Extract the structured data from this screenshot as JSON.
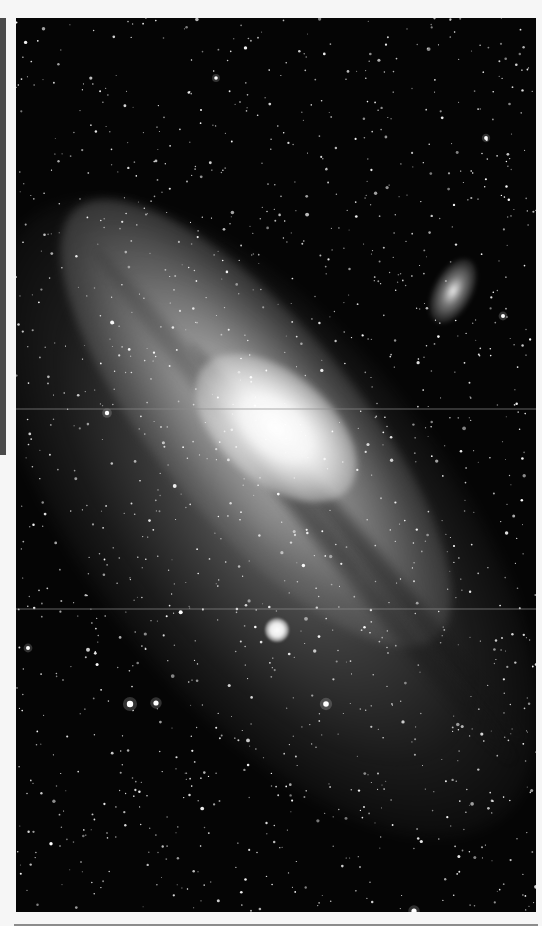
{
  "page": {
    "type": "scanned-book-page",
    "background_color": "#f6f6f6",
    "side_caption": {
      "text": "",
      "legible": false,
      "orientation": "vertical"
    }
  },
  "photo": {
    "subject": "Andromeda Galaxy (M31) with satellite galaxies M32 and M110",
    "style": "black-and-white astronomical photograph",
    "background_color": "#050505",
    "objects": [
      {
        "name": "M31 core",
        "x": 260,
        "y": 410,
        "description": "bright elliptical nucleus"
      },
      {
        "name": "M110",
        "x": 437,
        "y": 273,
        "description": "elongated satellite galaxy, upper right"
      },
      {
        "name": "M32",
        "x": 261,
        "y": 612,
        "description": "compact round satellite, below the disk"
      }
    ],
    "scan_artifacts": [
      {
        "type": "horizontal-line",
        "y": 390
      },
      {
        "type": "horizontal-line",
        "y": 590
      }
    ],
    "starfield": {
      "count": 1400,
      "seed": 31,
      "bright_stars": [
        {
          "x": 114,
          "y": 686,
          "r": 3.2
        },
        {
          "x": 140,
          "y": 685,
          "r": 2.6
        },
        {
          "x": 310,
          "y": 686,
          "r": 2.8
        },
        {
          "x": 91,
          "y": 395,
          "r": 2.2
        },
        {
          "x": 487,
          "y": 298,
          "r": 2.0
        },
        {
          "x": 398,
          "y": 893,
          "r": 2.6
        },
        {
          "x": 12,
          "y": 630,
          "r": 2.0
        },
        {
          "x": 470,
          "y": 120,
          "r": 1.9
        },
        {
          "x": 200,
          "y": 60,
          "r": 1.8
        }
      ]
    }
  }
}
